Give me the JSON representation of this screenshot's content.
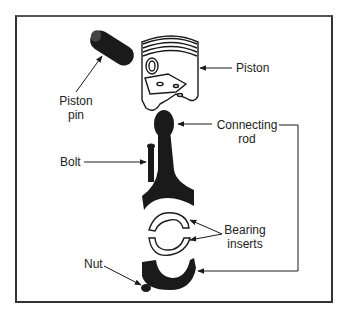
{
  "figure": {
    "type": "exploded-parts-diagram",
    "colors": {
      "ink": "#1a1a1a",
      "frame": "#333333",
      "background": "#ffffff"
    }
  },
  "labels": {
    "piston": "Piston",
    "piston_pin_line1": "Piston",
    "piston_pin_line2": "pin",
    "connecting_rod_line1": "Connecting",
    "connecting_rod_line2": "rod",
    "bolt": "Bolt",
    "bearing_inserts_line1": "Bearing",
    "bearing_inserts_line2": "inserts",
    "nut": "Nut"
  }
}
